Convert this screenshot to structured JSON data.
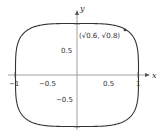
{
  "chart_data": {
    "type": "line",
    "title": "",
    "equation": "x^4 + y^4 = 1",
    "xlabel": "x",
    "ylabel": "y",
    "xlim": [
      -1.1,
      1.1
    ],
    "ylim": [
      -1.05,
      1.05
    ],
    "grid": false,
    "x_ticks": [
      "-1",
      "-0.5",
      "0.5",
      "1"
    ],
    "y_ticks": [
      "1",
      "0.5",
      "-0.5",
      "-1"
    ],
    "annotations": [
      {
        "point": [
          0.7746,
          0.8944
        ],
        "label": "(√0.6, √0.8)"
      }
    ],
    "series": [
      {
        "name": "superellipse",
        "color": "#333333"
      }
    ]
  },
  "labels": {
    "x_axis": "x",
    "y_axis": "y",
    "point_label": "(√0.6, √0.8)",
    "xt_m1": "−1",
    "xt_m05": "−0.5",
    "xt_05": "0.5",
    "xt_1": "1",
    "yt_1": "1",
    "yt_05": "0.5",
    "yt_m05": "−0.5",
    "yt_m1": "−1"
  }
}
